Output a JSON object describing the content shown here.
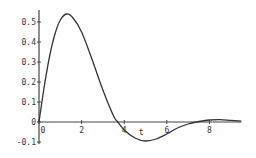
{
  "chart_data": {
    "type": "line",
    "title": "",
    "xlabel": "t",
    "ylabel": "",
    "xlim": [
      0,
      9.5
    ],
    "ylim": [
      -0.1,
      0.55
    ],
    "grid": false,
    "legend": null,
    "x_ticks": [
      "0",
      "2",
      "4",
      "6",
      "8"
    ],
    "y_ticks": [
      "-0.1",
      "0",
      "0.1",
      "0.2",
      "0.3",
      "0.4",
      "0.5"
    ],
    "series": [
      {
        "name": "response",
        "x": [
          0,
          0.25,
          0.5,
          0.75,
          1.0,
          1.3,
          1.6,
          2.0,
          2.5,
          3.0,
          3.5,
          3.7,
          4.0,
          4.5,
          5.0,
          5.5,
          6.0,
          6.5,
          7.0,
          7.4,
          8.0,
          8.5,
          9.0,
          9.5
        ],
        "values": [
          0,
          0.18,
          0.33,
          0.44,
          0.51,
          0.54,
          0.52,
          0.45,
          0.31,
          0.16,
          0.03,
          0.0,
          -0.04,
          -0.08,
          -0.095,
          -0.085,
          -0.06,
          -0.03,
          -0.01,
          0.0,
          0.01,
          0.012,
          0.008,
          0.004
        ]
      }
    ]
  }
}
